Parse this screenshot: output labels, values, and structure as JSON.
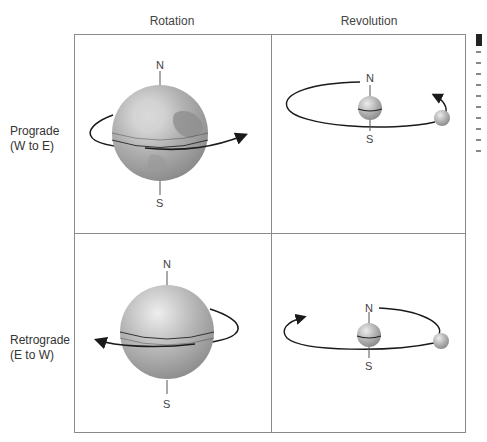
{
  "columns": [
    {
      "label": "Rotation"
    },
    {
      "label": "Revolution"
    }
  ],
  "rows": [
    {
      "label_line1": "Prograde",
      "label_line2": "(W to E)"
    },
    {
      "label_line1": "Retrograde",
      "label_line2": "(E to W)"
    }
  ],
  "cells": {
    "prograde_rotation": {
      "north": "N",
      "south": "S",
      "direction": "counterclockwise-from-north (arrow to right/front)"
    },
    "prograde_revolution": {
      "north": "N",
      "south": "S",
      "direction": "arrow at right going back"
    },
    "retrograde_rotation": {
      "north": "N",
      "south": "S",
      "direction": "arrow to left/front"
    },
    "retrograde_revolution": {
      "north": "N",
      "south": "S",
      "direction": "arrow at left going back"
    }
  },
  "colors": {
    "border": "#8a8a8a",
    "orbit_line": "#1a1a1a",
    "sphere_light": "#e6e6e6",
    "sphere_dark": "#8f8f8f",
    "continent": "#9c9c9c"
  }
}
